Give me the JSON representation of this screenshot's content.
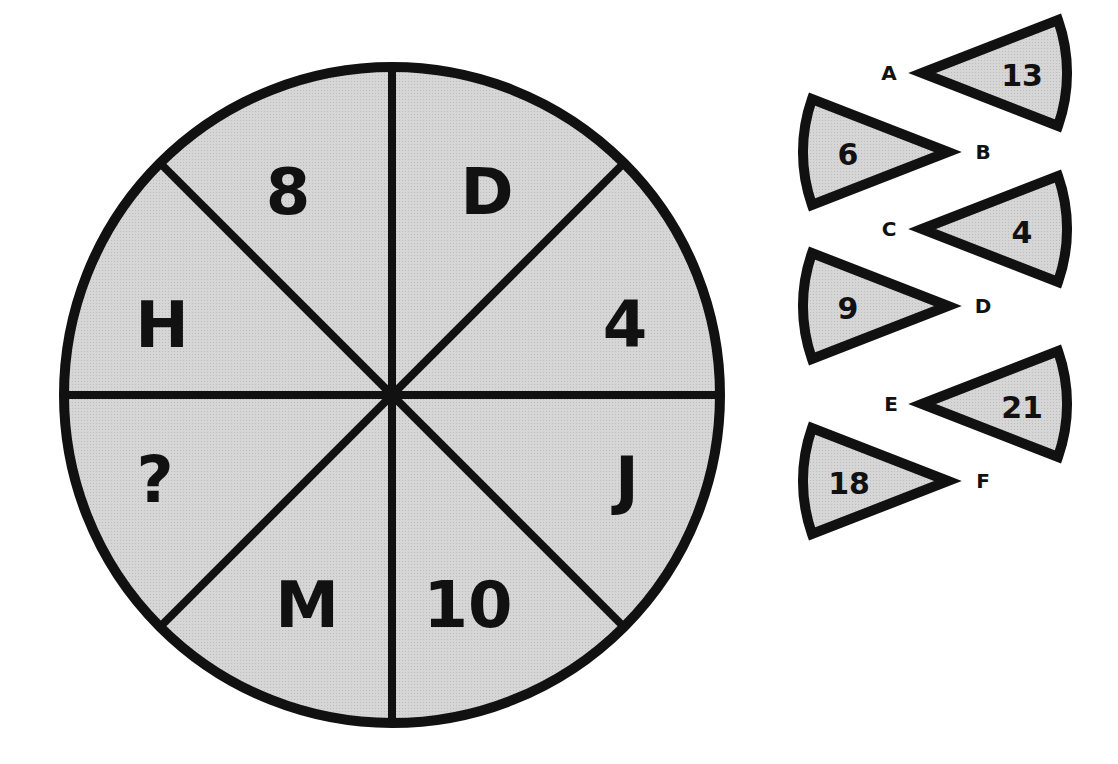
{
  "puzzle": {
    "wheel": {
      "segments": [
        {
          "position": "top-left",
          "value": "8"
        },
        {
          "position": "top-right",
          "value": "D"
        },
        {
          "position": "right-upper",
          "value": "4"
        },
        {
          "position": "right-lower",
          "value": "J"
        },
        {
          "position": "bottom-right",
          "value": "10"
        },
        {
          "position": "bottom-left",
          "value": "M"
        },
        {
          "position": "left-lower",
          "value": "?"
        },
        {
          "position": "left-upper",
          "value": "H"
        }
      ]
    },
    "options": [
      {
        "label": "A",
        "value": "13"
      },
      {
        "label": "B",
        "value": "6"
      },
      {
        "label": "C",
        "value": "4"
      },
      {
        "label": "D",
        "value": "9"
      },
      {
        "label": "E",
        "value": "21"
      },
      {
        "label": "F",
        "value": "18"
      }
    ],
    "colors": {
      "fill": "#d4d4d4",
      "stroke": "#111111",
      "background": "#ffffff"
    }
  }
}
